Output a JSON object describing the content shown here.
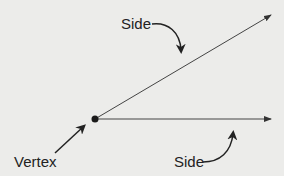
{
  "diagram": {
    "labels": {
      "upper_side": "Side",
      "vertex": "Vertex",
      "lower_side": "Side"
    },
    "colors": {
      "background": "#ececea",
      "ink": "#222222"
    }
  }
}
